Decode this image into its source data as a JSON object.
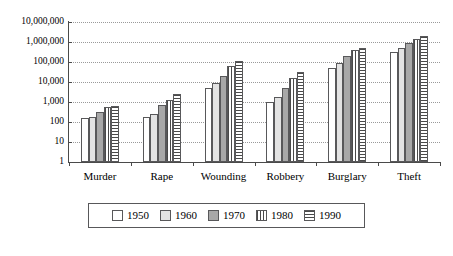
{
  "chart_data": {
    "type": "bar",
    "title": "",
    "xlabel": "",
    "ylabel": "",
    "yscale": "log",
    "ylim": [
      1,
      10000000
    ],
    "grid": true,
    "legend_position": "bottom",
    "categories": [
      "Murder",
      "Rape",
      "Wounding",
      "Robbery",
      "Burglary",
      "Theft"
    ],
    "ytick_labels": [
      "10,000,000",
      "1,000,000",
      "100,000",
      "10,000",
      "1,000",
      "100",
      "10",
      "1"
    ],
    "ytick_values": [
      10000000,
      1000000,
      100000,
      10000,
      1000,
      100,
      10,
      1
    ],
    "series": [
      {
        "name": "1950",
        "values": [
          160,
          170,
          5000,
          1000,
          50000,
          300000
        ]
      },
      {
        "name": "1960",
        "values": [
          180,
          250,
          9000,
          1800,
          90000,
          500000
        ]
      },
      {
        "name": "1970",
        "values": [
          300,
          700,
          20000,
          5000,
          200000,
          900000
        ]
      },
      {
        "name": "1980",
        "values": [
          550,
          1300,
          60000,
          15000,
          400000,
          1400000
        ]
      },
      {
        "name": "1990",
        "values": [
          600,
          2500,
          110000,
          33000,
          500000,
          2000000
        ]
      }
    ],
    "series_styles": [
      "1950",
      "1960",
      "1970",
      "1980",
      "1990"
    ]
  },
  "legend": {
    "items": [
      {
        "label": "1950",
        "pattern": "solid-white"
      },
      {
        "label": "1960",
        "pattern": "solid-light-gray"
      },
      {
        "label": "1970",
        "pattern": "solid-medium-gray"
      },
      {
        "label": "1980",
        "pattern": "vertical-stripes"
      },
      {
        "label": "1990",
        "pattern": "horizontal-stripes"
      }
    ]
  },
  "colors": {
    "axis": "#4a4a4a",
    "grid": "#9a9a9a",
    "bar_1950": "#ffffff",
    "bar_1960": "#e3e3e3",
    "bar_1970": "#a8a8a8",
    "bar_1980": "#cfcfcf",
    "bar_1990": "#cfcfcf",
    "background": "#ffffff"
  }
}
